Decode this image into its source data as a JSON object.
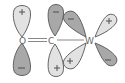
{
  "diagram": {
    "title": "",
    "atoms": [
      {
        "id": "O",
        "label": "O",
        "x": 23,
        "y": 40
      },
      {
        "id": "C",
        "label": "C",
        "x": 52,
        "y": 40
      },
      {
        "id": "W",
        "label": "W",
        "x": 90,
        "y": 40
      }
    ],
    "bonds": [
      {
        "from": "O",
        "to": "C",
        "order": 2
      },
      {
        "from": "C",
        "to": "W",
        "order": 1
      }
    ],
    "orbitals": [
      {
        "atom": "O",
        "position": "up",
        "phase": "+",
        "shade": "light"
      },
      {
        "atom": "O",
        "position": "down",
        "phase": "−",
        "shade": "dark"
      },
      {
        "atom": "C",
        "position": "up",
        "phase": "−",
        "shade": "dark"
      },
      {
        "atom": "C",
        "position": "down",
        "phase": "+",
        "shade": "light"
      },
      {
        "atom": "W",
        "position": "up-left",
        "phase": "−",
        "shade": "dark"
      },
      {
        "atom": "W",
        "position": "up-right",
        "phase": "+",
        "shade": "light"
      },
      {
        "atom": "W",
        "position": "down-left",
        "phase": "+",
        "shade": "light"
      },
      {
        "atom": "W",
        "position": "down-right",
        "phase": "−",
        "shade": "dark"
      }
    ],
    "colors": {
      "light_lobe": "#e2e2e2",
      "dark_lobe": "#a8a8a8",
      "outline": "#555555"
    }
  }
}
